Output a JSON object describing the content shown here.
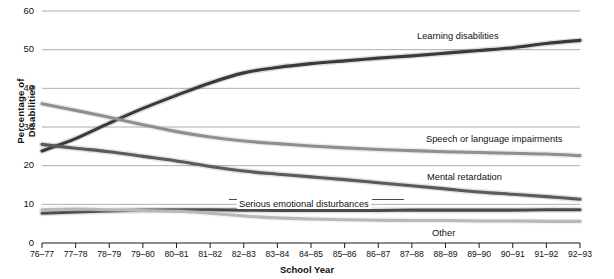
{
  "chart_data": {
    "type": "line",
    "title": "",
    "xlabel": "School Year",
    "ylabel": "Percentage of Disabilities",
    "ylim": [
      0,
      60
    ],
    "yticks": [
      0,
      10,
      20,
      30,
      40,
      50,
      60
    ],
    "ytick_labels": [
      "0",
      "10",
      "20",
      "30",
      "40",
      "50",
      "60"
    ],
    "grid": "horizontal",
    "legend": "inline-on-line",
    "categories": [
      "76–77",
      "77–78",
      "78–79",
      "79–80",
      "80–81",
      "81–82",
      "82–83",
      "83–84",
      "84–85",
      "85–86",
      "86–87",
      "87–88",
      "88–89",
      "89–90",
      "90–91",
      "91–92",
      "92–93"
    ],
    "series": [
      {
        "name": "Learning disabilities",
        "color": "#3a3a3a",
        "values": [
          23.8,
          27.0,
          31.0,
          34.8,
          38.2,
          41.4,
          44.0,
          45.4,
          46.4,
          47.1,
          47.8,
          48.4,
          49.1,
          49.8,
          50.5,
          51.6,
          52.4
        ]
      },
      {
        "name": "Speech or language impairments",
        "color": "#8f8f8f",
        "values": [
          36.0,
          34.3,
          32.5,
          30.6,
          28.8,
          27.4,
          26.4,
          25.7,
          25.1,
          24.6,
          24.2,
          23.9,
          23.6,
          23.4,
          23.2,
          23.0,
          22.6
        ]
      },
      {
        "name": "Mental retardation",
        "color": "#5a5a5a",
        "values": [
          25.5,
          24.5,
          23.6,
          22.4,
          21.2,
          19.8,
          18.6,
          17.8,
          17.1,
          16.4,
          15.6,
          14.8,
          14.0,
          13.2,
          12.6,
          12.0,
          11.3
        ]
      },
      {
        "name": "Serious emotional disturbances",
        "color": "#4a4a4a",
        "values": [
          7.7,
          8.0,
          8.3,
          8.5,
          8.6,
          8.6,
          8.5,
          8.4,
          8.4,
          8.4,
          8.4,
          8.5,
          8.5,
          8.5,
          8.5,
          8.6,
          8.6
        ]
      },
      {
        "name": "Other",
        "color": "#b8b8b8",
        "values": [
          8.6,
          8.8,
          8.6,
          8.4,
          8.2,
          7.7,
          7.0,
          6.5,
          6.2,
          6.0,
          5.9,
          5.8,
          5.8,
          5.7,
          5.7,
          5.6,
          5.6
        ]
      }
    ],
    "annotations": [
      {
        "text": "Learning disabilities",
        "x": 415,
        "y": 31
      },
      {
        "text": "Speech or language impairments",
        "x": 424,
        "y": 134
      },
      {
        "text": "Mental retardation",
        "x": 425,
        "y": 172
      },
      {
        "text": "Serious emotional disturbances",
        "x": 237,
        "y": 199
      },
      {
        "text": "Other",
        "x": 430,
        "y": 228
      }
    ]
  }
}
